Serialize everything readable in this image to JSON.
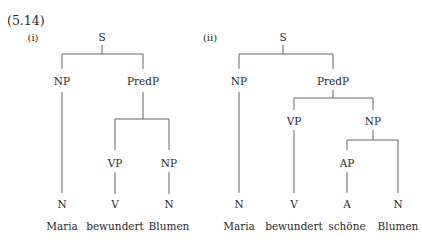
{
  "example_number": "(5.14)",
  "trees": [
    {
      "label": "(i)",
      "nodes": {
        "s": "S",
        "np": "NP",
        "predp": "PredP",
        "vp": "VP",
        "np2": "NP",
        "n1": "N",
        "v": "V",
        "n2": "N"
      },
      "words": [
        "Maria",
        "bewundert",
        "Blumen"
      ]
    },
    {
      "label": "(ii)",
      "nodes": {
        "s": "S",
        "np": "NP",
        "predp": "PredP",
        "vp": "VP",
        "np2": "NP",
        "ap": "AP",
        "n1": "N",
        "v": "V",
        "a": "A",
        "n2": "N"
      },
      "words": [
        "Maria",
        "bewundert",
        "schöne",
        "Blumen"
      ]
    }
  ],
  "colors": {
    "text": "#2a2a2a",
    "lines": "#555555",
    "background": "#ffffff"
  }
}
